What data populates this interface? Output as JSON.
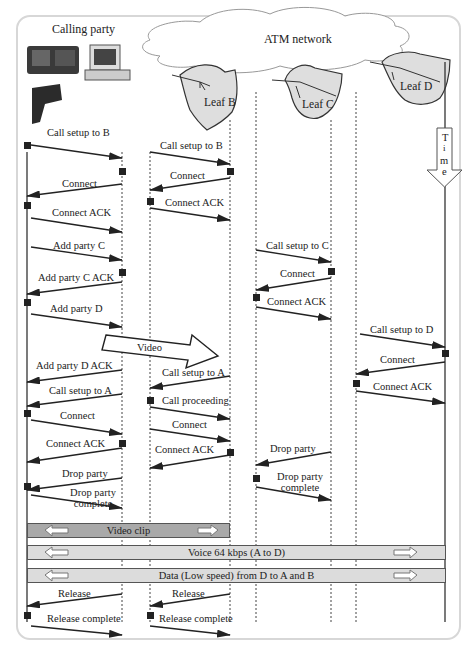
{
  "diagram": {
    "title_calling_party": "Calling party",
    "network_label": "ATM network",
    "leaves": [
      {
        "id": "B",
        "label": "Leaf B"
      },
      {
        "id": "C",
        "label": "Leaf C"
      },
      {
        "id": "D",
        "label": "Leaf D"
      }
    ],
    "time_arrow": {
      "letters": [
        "T",
        "i",
        "m",
        "e"
      ]
    },
    "colors": {
      "line": "#333333",
      "leaf_fill": "#dedede",
      "band_dark": "#a9a9a9",
      "band_light": "#dcdcdc",
      "frame": "#d7d7d7"
    },
    "messages": {
      "m1": "Call setup to B",
      "m2": "Call setup to B",
      "m3": "Connect",
      "m4": "Connect",
      "m5": "Connect ACK",
      "m6": "Connect ACK",
      "m7": "Add party C",
      "m8": "Call setup to C",
      "m9": "Add party C ACK",
      "m10": "Connect",
      "m11": "Add party D",
      "m12": "Connect ACK",
      "m13": "Call setup to D",
      "m14": "Video",
      "m15": "Connect",
      "m16": "Add party D ACK",
      "m17": "Connect ACK",
      "m18": "Call setup to A",
      "m19": "Call setup to A",
      "m20": "Call proceeding",
      "m21": "Connect",
      "m22": "Connect",
      "m23": "Connect ACK",
      "m24": "Connect ACK",
      "m25": "Drop party",
      "m26": "Drop party",
      "m27_line1": "Drop party",
      "m27_line2": "complete",
      "m28_line1": "Drop party",
      "m28_line2": "complete",
      "m29": "Release",
      "m30": "Release",
      "m31": "Release complete",
      "m32": "Release complete"
    },
    "bands": {
      "video_clip": "Video clip",
      "voice": "Voice 64 kbps (A to D)",
      "data": "Data (Low speed) from D to A and B"
    }
  }
}
